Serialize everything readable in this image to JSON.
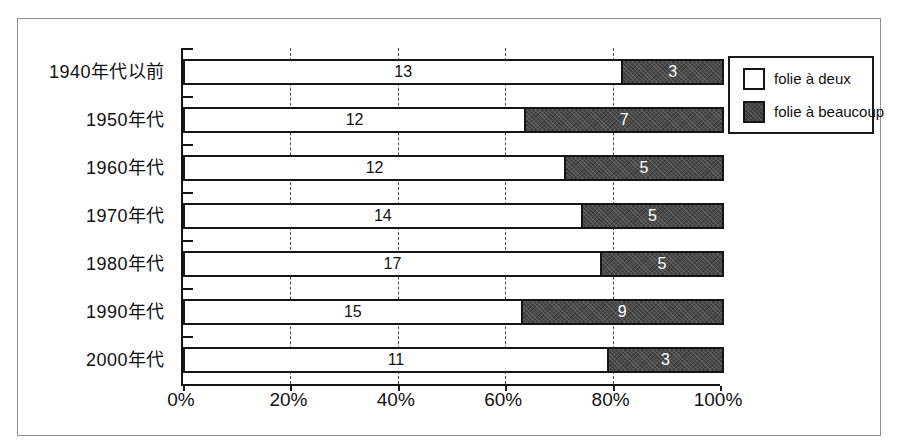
{
  "chart_data": {
    "type": "bar",
    "orientation": "horizontal",
    "stacking": "percent",
    "categories": [
      "1940年代以前",
      "1950年代",
      "1960年代",
      "1970年代",
      "1980年代",
      "1990年代",
      "2000年代"
    ],
    "series": [
      {
        "name": "folie à deux",
        "values": [
          13,
          12,
          12,
          14,
          17,
          15,
          11
        ],
        "fill": "#ffffff",
        "label_color": "#111111"
      },
      {
        "name": "folie à beaucoup",
        "values": [
          3,
          7,
          5,
          5,
          5,
          9,
          3
        ],
        "fill": "#4a4a4a",
        "label_color": "#ffffff"
      }
    ],
    "x_ticks": [
      "0%",
      "20%",
      "40%",
      "60%",
      "80%",
      "100%"
    ],
    "xlim": [
      0,
      100
    ],
    "grid": "dashed vertical lines at 20/40/60/80%",
    "legend_position": "top-right",
    "title": "",
    "xlabel": "",
    "ylabel": ""
  },
  "legend": {
    "items": [
      {
        "label": "folie à deux",
        "swatch": "white"
      },
      {
        "label": "folie à beaucoup",
        "swatch": "dark-hatched"
      }
    ]
  },
  "colors": {
    "dark_series_fill": "#4a4a4a",
    "bar_border": "#151515",
    "figure_border": "#8f8f8f",
    "background": "#ffffff"
  }
}
